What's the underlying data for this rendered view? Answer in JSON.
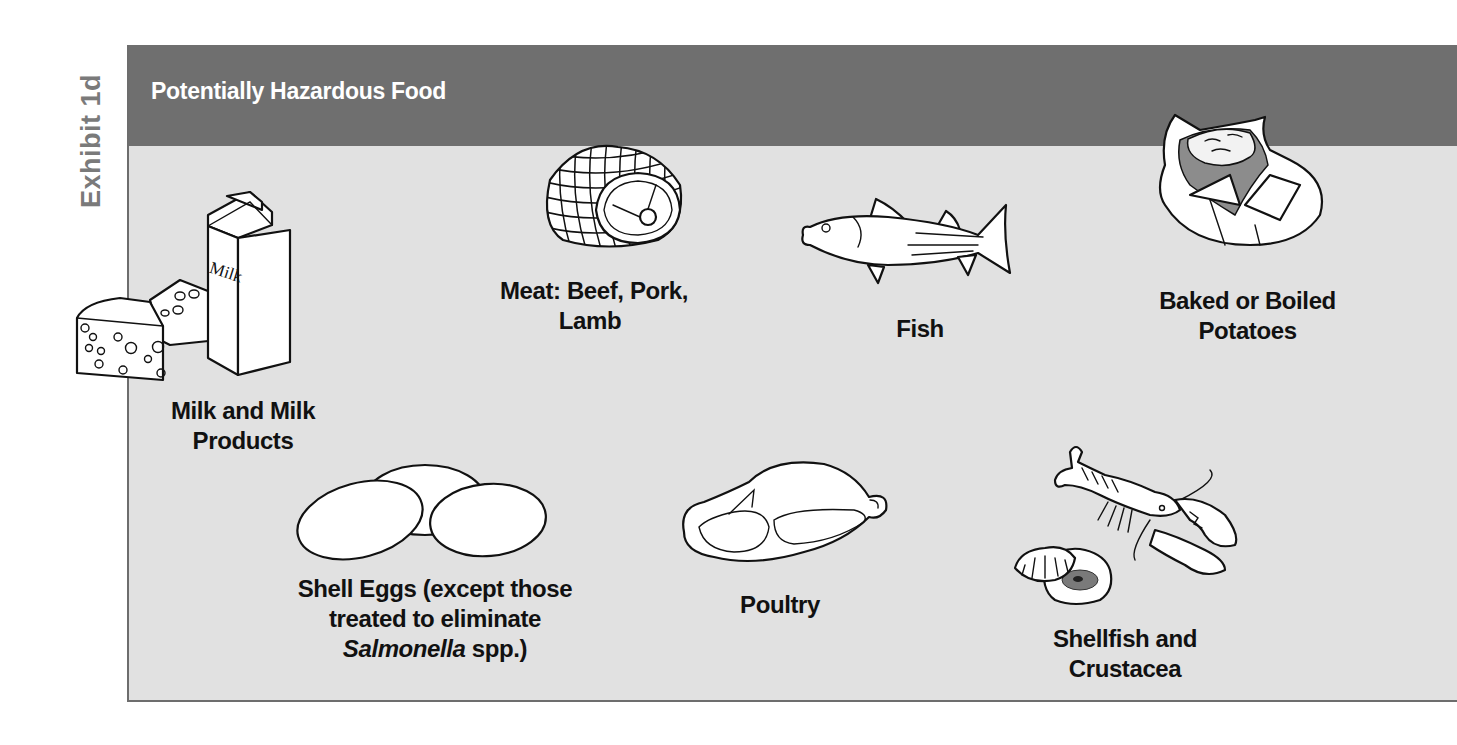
{
  "exhibit": {
    "label": "Exhibit 1d"
  },
  "header": {
    "title": "Potentially Hazardous Food"
  },
  "items": [
    {
      "id": "milk",
      "icon": "milk-carton-and-cheese-icon",
      "carton_text": "Milk",
      "caption_lines": [
        "Milk and Milk",
        "Products"
      ]
    },
    {
      "id": "meat",
      "icon": "netted-roast-icon",
      "caption_lines": [
        "Meat: Beef, Pork,",
        "Lamb"
      ]
    },
    {
      "id": "fish",
      "icon": "fish-icon",
      "caption_lines": [
        "Fish"
      ]
    },
    {
      "id": "potatoes",
      "icon": "baked-potato-icon",
      "caption_lines": [
        "Baked or Boiled",
        "Potatoes"
      ]
    },
    {
      "id": "eggs",
      "icon": "eggs-icon",
      "caption_lines": [
        "Shell Eggs (except those",
        "treated to eliminate"
      ],
      "caption_italic": "Salmonella",
      "caption_tail": " spp.)"
    },
    {
      "id": "poultry",
      "icon": "roast-poultry-icon",
      "caption_lines": [
        "Poultry"
      ]
    },
    {
      "id": "shellfish",
      "icon": "lobster-and-clam-icon",
      "caption_lines": [
        "Shellfish and",
        "Crustacea"
      ]
    }
  ],
  "colors": {
    "header_band": "#6f6f6f",
    "panel_background": "#e1e1e1",
    "exhibit_label": "#7a7a7a",
    "caption_text": "#111111"
  }
}
